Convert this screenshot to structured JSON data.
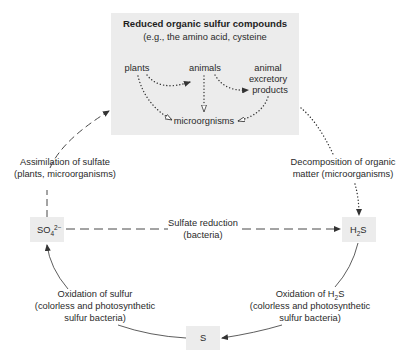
{
  "diagram": {
    "type": "cycle",
    "topic": "Sulfur cycle",
    "colors": {
      "box_fill": "#ececec",
      "line": "#333333",
      "text": "#2a2a2a",
      "background": "#ffffff"
    },
    "organic_box": {
      "title": "Reduced organic sulfur compounds",
      "subtitle": "(e.g., the amino acid, cysteine",
      "nodes": {
        "plants": "plants",
        "animals": "animals",
        "excretory_line1": "animal",
        "excretory_line2": "excretory",
        "excretory_line3": "products",
        "microorganisms": "microorgnisms"
      }
    },
    "compounds": {
      "sulfate_base": "SO",
      "sulfate_sub": "4",
      "sulfate_sup": "2−",
      "h2s_h": "H",
      "h2s_sub": "2",
      "h2s_s": "S",
      "sulfur": "S"
    },
    "processes": {
      "assimilation_line1": "Assimilation of sulfate",
      "assimilation_line2": "(plants, microorganisms)",
      "decomposition_line1": "Decomposition of organic",
      "decomposition_line2": "matter (microorganisms)",
      "reduction_line1": "Sulfate reduction",
      "reduction_line2": "(bacteria)",
      "oxidation_s_line1": "Oxidation of sulfur",
      "oxidation_s_line2": "(colorless and photosynthetic",
      "oxidation_s_line3": "sulfur bacteria)",
      "oxidation_h2s_line1a": "Oxidation of H",
      "oxidation_h2s_line1sub": "2",
      "oxidation_h2s_line1b": "S",
      "oxidation_h2s_line2": "(colorless and photosynthetic",
      "oxidation_h2s_line3": "sulfur bacteria)"
    },
    "edges": [
      {
        "from": "SO4",
        "to": "organic_box",
        "label": "Assimilation of sulfate",
        "style": "dashed"
      },
      {
        "from": "organic_box",
        "to": "H2S",
        "label": "Decomposition of organic matter",
        "style": "dotted"
      },
      {
        "from": "SO4",
        "to": "H2S",
        "label": "Sulfate reduction",
        "style": "dashed"
      },
      {
        "from": "H2S",
        "to": "S",
        "label": "Oxidation of H2S",
        "style": "solid"
      },
      {
        "from": "S",
        "to": "SO4",
        "label": "Oxidation of sulfur",
        "style": "solid"
      },
      {
        "from": "plants",
        "to": "animals",
        "style": "dotted"
      },
      {
        "from": "animals",
        "to": "animal excretory products",
        "style": "dotted"
      },
      {
        "from": "plants",
        "to": "microorgnisms",
        "style": "dotted"
      },
      {
        "from": "animals",
        "to": "microorgnisms",
        "style": "dotted"
      },
      {
        "from": "animal excretory products",
        "to": "microorgnisms",
        "style": "dotted"
      }
    ]
  }
}
